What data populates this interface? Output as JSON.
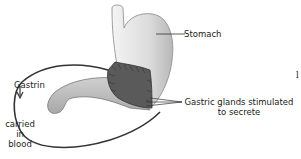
{
  "diagram": {
    "labels": {
      "stomach": "Stomach",
      "gastric_glands_line1": "Gastric glands stimulated",
      "gastric_glands_line2": "to secrete",
      "gastrin": "Gastrin",
      "carried_line1": "carried",
      "carried_line2": "in",
      "carried_line3": "blood",
      "page_mark": "l"
    },
    "colors": {
      "stomach_fill": "#e6e6e6",
      "stomach_shade": "#c8c8c8",
      "gland_region": "#555555",
      "vessel": "#333333",
      "text": "#222222"
    }
  }
}
